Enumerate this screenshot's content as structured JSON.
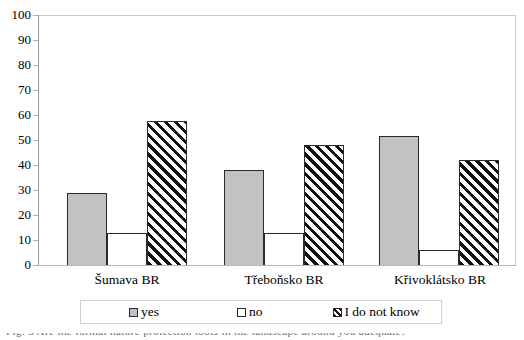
{
  "chart_data": {
    "type": "bar",
    "title": "",
    "xlabel": "",
    "ylabel": "",
    "ylim": [
      0,
      100
    ],
    "ytick_step": 10,
    "yticks": [
      100,
      90,
      80,
      70,
      60,
      50,
      40,
      30,
      20,
      10,
      0
    ],
    "grid": false,
    "legend_position": "bottom",
    "categories": [
      "Šumava BR",
      "Třeboňsko BR",
      "Křivoklátsko BR"
    ],
    "series": [
      {
        "name": "yes",
        "values": [
          29,
          38,
          52
        ],
        "style": "solid-gray",
        "color": "#c2c2c2"
      },
      {
        "name": "no",
        "values": [
          13,
          13,
          6
        ],
        "style": "solid-white",
        "color": "#ffffff"
      },
      {
        "name": "I do not know",
        "values": [
          58,
          48,
          42
        ],
        "style": "diagonal-hatch",
        "color": "#ffffff"
      }
    ]
  },
  "axis": {
    "y_tick_labels": [
      "100",
      "90",
      "80",
      "70",
      "60",
      "50",
      "40",
      "30",
      "20",
      "10",
      "0"
    ]
  },
  "categories": [
    {
      "label": "Šumava BR"
    },
    {
      "label": "Třeboňsko BR"
    },
    {
      "label": "Křivoklátsko BR"
    }
  ],
  "legend": {
    "items": [
      {
        "label": "yes"
      },
      {
        "label": "no"
      },
      {
        "label": "I do not know"
      }
    ]
  },
  "caption": {
    "remnant_text": "Fig. 3   Are the formal nature protection tools in the landscape around you adequate?"
  },
  "colors": {
    "series_yes": "#c2c2c2",
    "series_no": "#ffffff",
    "series_idk": "#ffffff",
    "bar_outline": "#2a2a2a",
    "frame": "#c9c9c9",
    "axis": "#9a9a9a",
    "text": "#000000"
  }
}
